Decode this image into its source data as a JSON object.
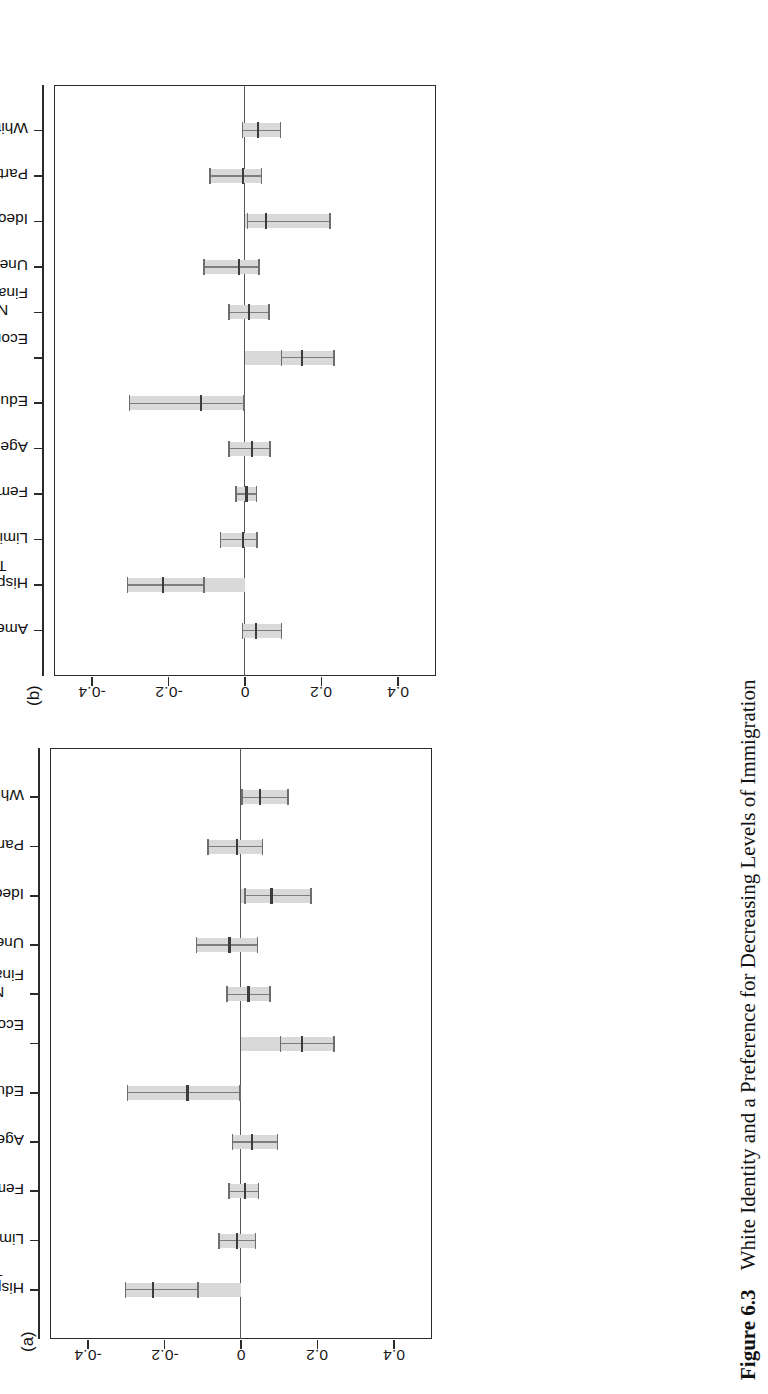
{
  "figure": {
    "caption_label": "Figure 6.3",
    "caption_text": "White Identity and a Preference for Decreasing Levels of Immigration",
    "panel_a_letter": "(a)",
    "panel_b_letter": "(b)",
    "rotation": "figure printed sideways (rotated 90° counter-clockwise on page)"
  },
  "axis": {
    "tick_labels": [
      "-0.4",
      "-0.2",
      "0",
      "0.2",
      "0.4"
    ],
    "tick_values": [
      -0.4,
      -0.2,
      0,
      0.2,
      0.4
    ],
    "min": -0.5,
    "max": 0.5,
    "zero_reference_label": "0"
  },
  "chart_data": [
    {
      "type": "bar",
      "panel": "(a)",
      "title": "",
      "subtitle": "",
      "xlabel": "",
      "ylabel": "",
      "ylim": [
        -0.5,
        0.5
      ],
      "grid": false,
      "legend": "none",
      "orientation": "vertical-coefficient-plot",
      "zero_line": 0,
      "categories": [
        "White Identity",
        "Party Identity",
        "Ideology",
        "Unemployed",
        "Negative Personal Financial Evaluations",
        "Negative National Economic Evaluations",
        "Education",
        "Age",
        "Female",
        "Limited Government",
        "Hispanic Feeling Thermometer"
      ],
      "category_lines": [
        [
          "White Identity"
        ],
        [
          "Party Identity"
        ],
        [
          "Ideology"
        ],
        [
          "Unemployed"
        ],
        [
          "Negative Personal",
          "Financial Evaluations"
        ],
        [
          "Negative National",
          "Economic Evaluations"
        ],
        [
          "Education"
        ],
        [
          "Age"
        ],
        [
          "Female"
        ],
        [
          "Limited Government"
        ],
        [
          "Hispanic Feeling",
          "Thermometer"
        ]
      ],
      "values": [
        0.05,
        -0.01,
        0.08,
        -0.03,
        0.02,
        0.16,
        -0.14,
        0.03,
        0.01,
        -0.01,
        -0.23
      ],
      "ci_low": [
        0.005,
        -0.085,
        0.012,
        -0.115,
        -0.035,
        0.105,
        -0.295,
        -0.02,
        -0.03,
        -0.055,
        -0.3
      ],
      "ci_high": [
        0.125,
        0.058,
        0.185,
        0.045,
        0.078,
        0.245,
        0.0,
        0.098,
        0.048,
        0.04,
        -0.11
      ],
      "series": [
        {
          "name": "Coefficient estimate with 95% confidence interval",
          "values": [
            0.05,
            -0.01,
            0.08,
            -0.03,
            0.02,
            0.16,
            -0.14,
            0.03,
            0.01,
            -0.01,
            -0.23
          ]
        }
      ]
    },
    {
      "type": "bar",
      "panel": "(b)",
      "title": "",
      "subtitle": "",
      "xlabel": "",
      "ylabel": "",
      "ylim": [
        -0.5,
        0.5
      ],
      "grid": false,
      "legend": "none",
      "orientation": "vertical-coefficient-plot",
      "zero_line": 0,
      "categories": [
        "White Identity",
        "Party Identity",
        "Ideology",
        "Unemployed",
        "Negative Personal Financial Evaluations",
        "Negative National Economic Evaluations",
        "Education",
        "Age",
        "Female",
        "Limited Government",
        "Hispanic Feeling Thermometer",
        "American Identity"
      ],
      "category_lines": [
        [
          "White Identity"
        ],
        [
          "Party Identity"
        ],
        [
          "Ideology"
        ],
        [
          "Unemployed"
        ],
        [
          "Negative Personal",
          "Financial Evaluations"
        ],
        [
          "Negative National",
          "Economic Evaluations"
        ],
        [
          "Education"
        ],
        [
          "Age"
        ],
        [
          "Female"
        ],
        [
          "Limited Government"
        ],
        [
          "Hispanic Feeling",
          "Thermometer"
        ],
        [
          "American Identity"
        ]
      ],
      "values": [
        0.035,
        -0.005,
        0.055,
        -0.015,
        0.01,
        0.15,
        -0.115,
        0.018,
        0.004,
        -0.004,
        -0.215,
        0.03
      ],
      "ci_low": [
        -0.005,
        -0.09,
        0.008,
        -0.105,
        -0.04,
        0.098,
        -0.3,
        -0.04,
        -0.022,
        -0.062,
        -0.305,
        -0.005
      ],
      "ci_high": [
        0.095,
        0.045,
        0.225,
        0.038,
        0.065,
        0.235,
        0.0,
        0.068,
        0.032,
        0.034,
        -0.105,
        0.098
      ],
      "series": [
        {
          "name": "Coefficient estimate with 95% confidence interval",
          "values": [
            0.035,
            -0.005,
            0.055,
            -0.015,
            0.01,
            0.15,
            -0.115,
            0.018,
            0.004,
            -0.004,
            -0.215,
            0.03
          ]
        }
      ]
    }
  ],
  "colors": {
    "bar_fill": "#d9d9d9",
    "whisker": "#7d7d7d",
    "point": "#3c3c3c",
    "frame": "#2b2b2b",
    "text": "#111111",
    "background": "#ffffff"
  }
}
